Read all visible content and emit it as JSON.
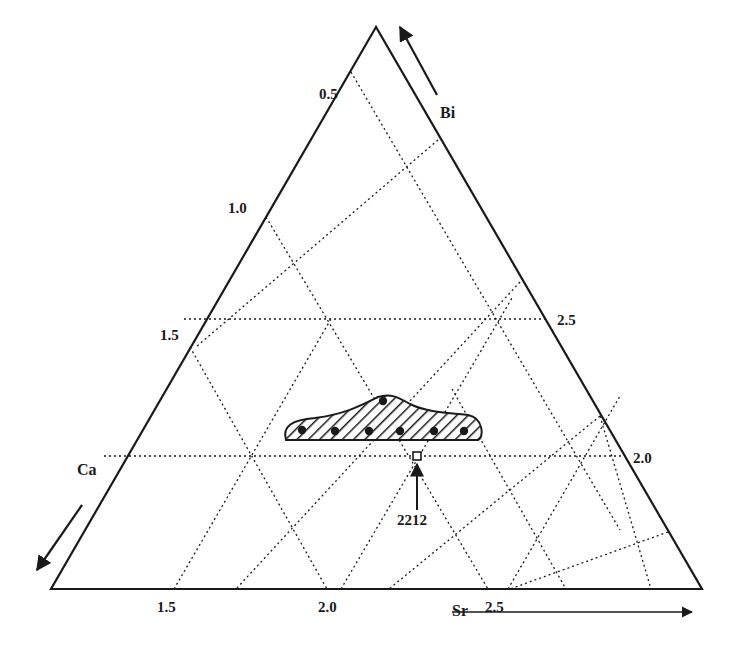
{
  "diagram": {
    "type": "ternary-phase-diagram",
    "components": {
      "top": "Bi",
      "left": "Ca",
      "right": "Sr"
    },
    "axis_labels": {
      "bi": "Bi",
      "ca": "Ca",
      "sr": "Sr"
    },
    "ticks": {
      "left_edge": [
        "0.5",
        "1.0",
        "1.5"
      ],
      "right_edge": [
        "2.5",
        "2.0"
      ],
      "bottom_edge": [
        "1.5",
        "2.0",
        "2.5"
      ]
    },
    "annotation": {
      "label": "2212",
      "marker": "open-square"
    },
    "region": {
      "fill": "diagonal-hatch",
      "description": "single-phase region",
      "points_count": 7
    },
    "colors": {
      "ink": "#1a1a1a",
      "background": "#ffffff"
    }
  },
  "geometry": {
    "triangle": [
      [
        376,
        27
      ],
      [
        51,
        589
      ],
      [
        702,
        589
      ]
    ],
    "horizontal_grid": [
      [
        [
          184,
          319
        ],
        [
          545,
          319
        ]
      ],
      [
        [
          104,
          456
        ],
        [
          626,
          456
        ]
      ]
    ],
    "grid_down_right": [
      [
        [
          351,
          72
        ],
        [
          620,
          530
        ]
      ],
      [
        [
          266,
          217
        ],
        [
          488,
          589
        ]
      ],
      [
        [
          190,
          347
        ],
        [
          327,
          589
        ]
      ]
    ],
    "grid_up_left": [
      [
        [
          438,
          140
        ],
        [
          196,
          347
        ]
      ],
      [
        [
          520,
          282
        ],
        [
          236,
          589
        ]
      ],
      [
        [
          600,
          416
        ],
        [
          389,
          589
        ]
      ],
      [
        [
          668,
          532
        ],
        [
          510,
          589
        ]
      ]
    ],
    "grid_down_right_2": [
      [
        [
          452,
          389
        ],
        [
          566,
          589
        ]
      ],
      [
        [
          600,
          416
        ],
        [
          651,
          589
        ]
      ]
    ],
    "grid_up_right": [
      [
        [
          174,
          589
        ],
        [
          331,
          319
        ]
      ],
      [
        [
          341,
          589
        ],
        [
          512,
          298
        ]
      ],
      [
        [
          508,
          589
        ],
        [
          620,
          396
        ]
      ]
    ],
    "grid_down_left_from_top": [
      [
        [
          331,
          319
        ],
        [
          174,
          589
        ]
      ]
    ],
    "region_path": "M 286 440 C 282 426, 292 420, 315 418 C 345 414, 360 406, 378 397 C 390 393, 398 397, 410 404 C 425 412, 450 413, 468 415 C 484 418, 484 438, 478 440 Z",
    "points": [
      [
        383,
        401
      ],
      [
        302,
        430
      ],
      [
        335,
        431
      ],
      [
        369,
        431
      ],
      [
        400,
        431
      ],
      [
        434,
        431
      ],
      [
        464,
        431
      ]
    ],
    "square_2212": [
      417,
      456
    ],
    "arrow_2212": [
      [
        417,
        510
      ],
      [
        417,
        464
      ]
    ],
    "arrow_bi": [
      [
        437,
        95
      ],
      [
        400,
        27
      ]
    ],
    "arrow_ca": [
      [
        82,
        505
      ],
      [
        37,
        570
      ]
    ],
    "arrow_sr": [
      [
        452,
        612
      ],
      [
        692,
        612
      ]
    ]
  },
  "label_positions": {
    "bi": [
      440,
      105
    ],
    "ca": [
      77,
      462
    ],
    "sr": [
      452,
      603
    ],
    "tick_left_0_5": [
      319,
      87
    ],
    "tick_left_1_0": [
      228,
      201
    ],
    "tick_left_1_5": [
      160,
      328
    ],
    "tick_right_2_5": [
      557,
      313
    ],
    "tick_right_2_0": [
      633,
      451
    ],
    "tick_bottom_1_5": [
      157,
      600
    ],
    "tick_bottom_2_0": [
      318,
      600
    ],
    "tick_bottom_2_5": [
      485,
      600
    ],
    "label_2212": [
      397,
      513
    ]
  }
}
